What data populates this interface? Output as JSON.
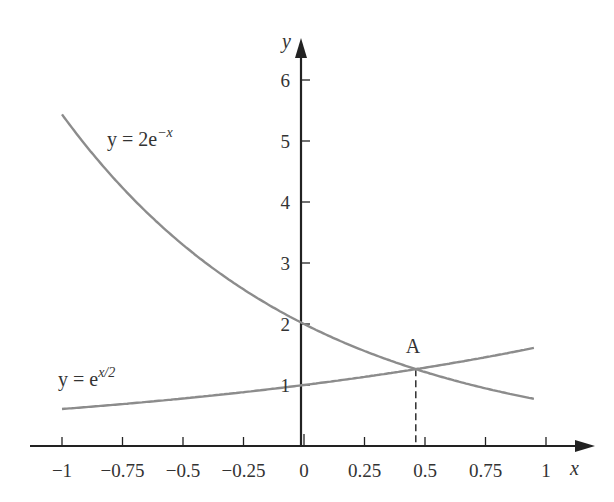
{
  "chart_data": {
    "type": "line",
    "title": "",
    "xlabel": "x",
    "ylabel": "y",
    "xlim": [
      -1.1,
      1.2
    ],
    "ylim": [
      0,
      6.6
    ],
    "x_ticks": [
      "-1",
      "-0.75",
      "-0.5",
      "-0.25",
      "0",
      "0.25",
      "0.5",
      "0.75",
      "1"
    ],
    "y_ticks": [
      "1",
      "2",
      "3",
      "4",
      "5",
      "6"
    ],
    "grid": false,
    "series": [
      {
        "name": "y = 2e^{-x}",
        "label_main": "y = 2e",
        "label_sup": "−x",
        "x_range": [
          -1,
          0.95
        ],
        "color": "#8c8c8c"
      },
      {
        "name": "y = e^{x/2}",
        "label_main": "y = e",
        "label_sup": "x/2",
        "x_range": [
          -1,
          0.95
        ],
        "color": "#8c8c8c"
      }
    ],
    "annotations": [
      {
        "label": "A",
        "x": 0.462,
        "y": 1.26,
        "note": "intersection point with dashed drop line to x-axis"
      }
    ]
  }
}
